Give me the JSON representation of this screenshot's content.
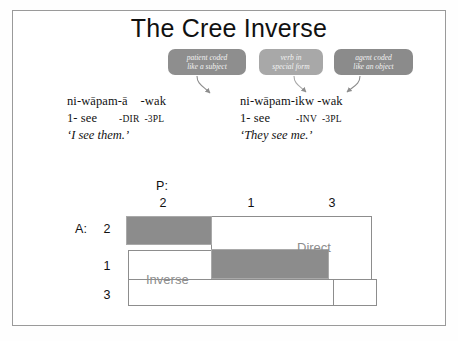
{
  "slide": {
    "title": "The Cree Inverse"
  },
  "callouts": [
    {
      "id": "patient",
      "line1": "patient coded",
      "line2": "like a subject",
      "color": "#8e8e8e"
    },
    {
      "id": "verb",
      "line1": "verb in",
      "line2": "special form",
      "color": "#a8a8a8"
    },
    {
      "id": "agent",
      "line1": "agent coded",
      "line2": "like an object",
      "color": "#8b8b8b"
    }
  ],
  "examples": {
    "left": {
      "morphemes": "ni-wāpam-ā    -wak",
      "gloss_part1": "1- see",
      "gloss_part2": "-DIR",
      "gloss_part3": "-3PL",
      "translation": "‘I see them.’"
    },
    "right": {
      "morphemes": "ni-wāpam-ikw -wak",
      "gloss_part1": "1- see",
      "gloss_part2": "-INV",
      "gloss_part3": "-3PL",
      "translation": "‘They see me.’"
    }
  },
  "diagram": {
    "patient_axis_label": "P:",
    "agent_axis_label": "A:",
    "columns": [
      "2",
      "1",
      "3"
    ],
    "rows": [
      "2",
      "1",
      "3"
    ],
    "region_direct": "Direct",
    "region_inverse": "Inverse",
    "fill_color": "#8c8c8c",
    "outline_color": "#8d8d8d"
  }
}
